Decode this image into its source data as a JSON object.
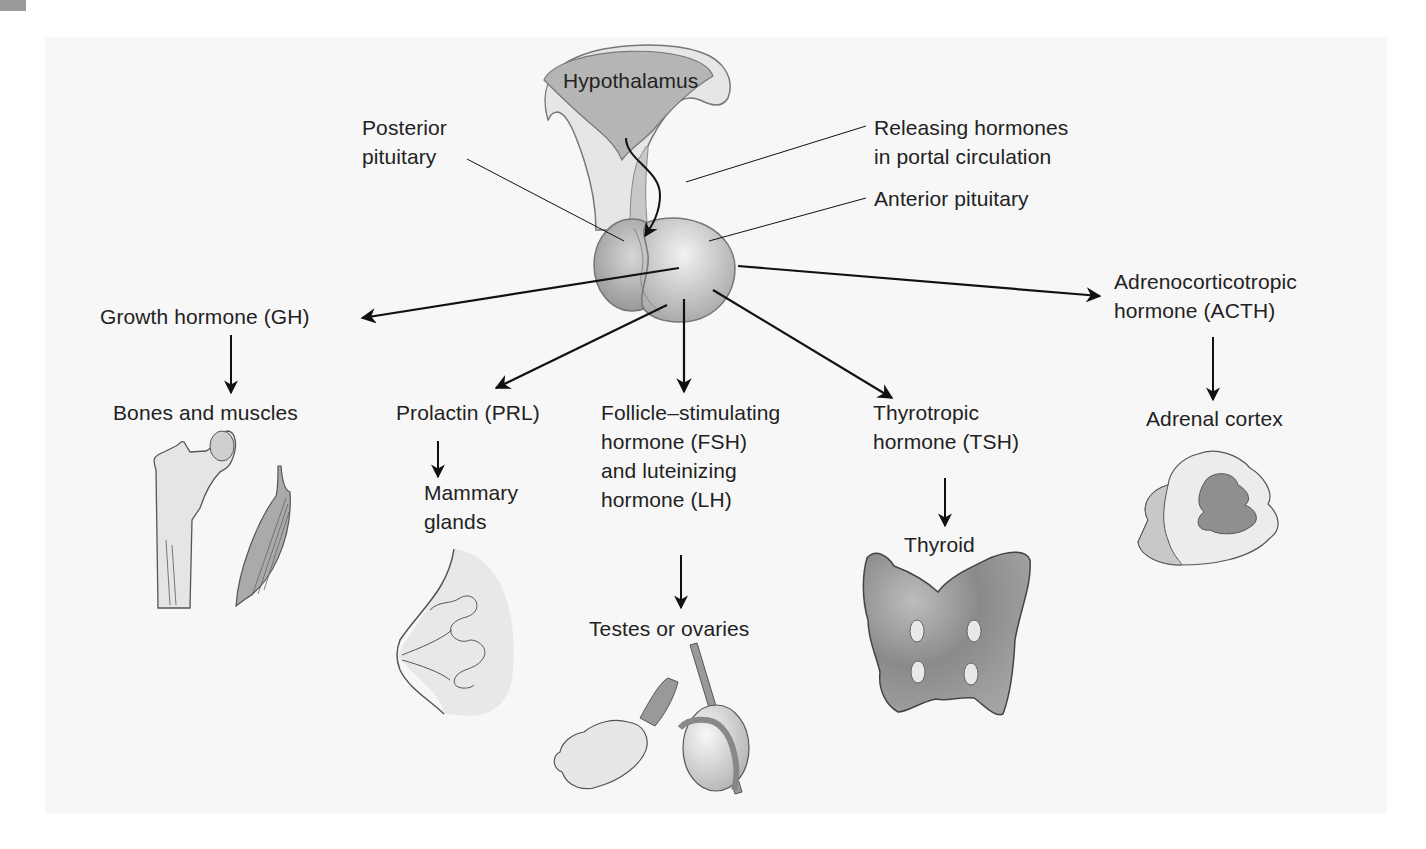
{
  "figure": {
    "hypothalamus": "Hypothalamus",
    "posterior_pituitary": [
      "Posterior",
      "pituitary"
    ],
    "releasing_hormones": [
      "Releasing hormones",
      "in portal circulation"
    ],
    "anterior_pituitary": "Anterior pituitary",
    "hormones": [
      {
        "name": "growth-hormone",
        "label": [
          "Growth hormone (GH)"
        ],
        "target": [
          "Bones and muscles"
        ]
      },
      {
        "name": "prolactin",
        "label": [
          "Prolactin (PRL)"
        ],
        "target": [
          "Mammary",
          "glands"
        ]
      },
      {
        "name": "fsh-lh",
        "label": [
          "Follicle–stimulating",
          "hormone (FSH)",
          "and luteinizing",
          "hormone (LH)"
        ],
        "target": [
          "Testes or ovaries"
        ]
      },
      {
        "name": "tsh",
        "label": [
          "Thyrotropic",
          "hormone (TSH)"
        ],
        "target": [
          "Thyroid"
        ]
      },
      {
        "name": "acth",
        "label": [
          "Adrenocorticotropic",
          "hormone (ACTH)"
        ],
        "target": [
          "Adrenal cortex"
        ]
      }
    ]
  },
  "colors": {
    "panel_bg": "#f7f7f7",
    "gland_gray": "#b8b8b8",
    "gland_dark": "#8f8f8f",
    "line": "#111111",
    "text": "#222222"
  }
}
